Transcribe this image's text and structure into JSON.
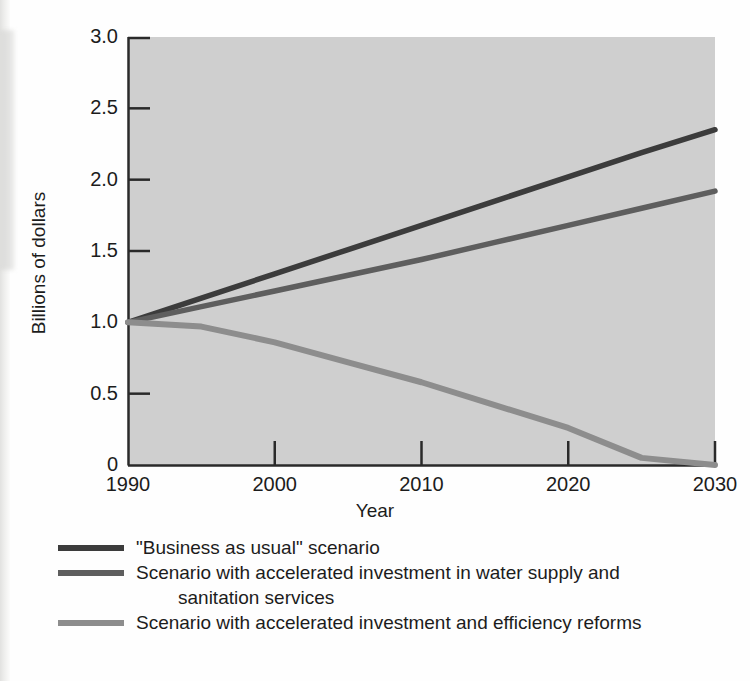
{
  "chart_data": {
    "type": "line",
    "title": "",
    "xlabel": "Year",
    "ylabel": "Billions of dollars",
    "xlim": [
      1990,
      2030
    ],
    "ylim": [
      0,
      3.0
    ],
    "grid": false,
    "legend_position": "below",
    "x_ticks": [
      "1990",
      "2000",
      "2010",
      "2020",
      "2030"
    ],
    "x_tick_values": [
      1990,
      2000,
      2010,
      2020,
      2030
    ],
    "y_ticks": [
      "0",
      "0.5",
      "1.0",
      "1.5",
      "2.0",
      "2.5",
      "3.0"
    ],
    "y_tick_values": [
      0,
      0.5,
      1.0,
      1.5,
      2.0,
      2.5,
      3.0
    ],
    "x": [
      1990,
      1995,
      2000,
      2005,
      2010,
      2015,
      2020,
      2025,
      2030
    ],
    "series": [
      {
        "name": "\"Business as usual\" scenario",
        "color": "#3c3c3c",
        "values": [
          1.0,
          1.17,
          1.34,
          1.51,
          1.68,
          1.85,
          2.02,
          2.19,
          2.35
        ]
      },
      {
        "name": "Scenario with accelerated investment in water supply and sanitation services",
        "color": "#5e5e5e",
        "values": [
          1.0,
          1.11,
          1.22,
          1.33,
          1.44,
          1.56,
          1.68,
          1.8,
          1.92
        ]
      },
      {
        "name": "Scenario with accelerated investment and efficiency reforms",
        "color": "#8d8d8d",
        "values": [
          1.0,
          0.97,
          0.86,
          0.72,
          0.58,
          0.42,
          0.26,
          0.05,
          0.0
        ]
      }
    ],
    "plot_background": "#cfcfcf"
  },
  "legend": {
    "entries": [
      {
        "label": "\"Business as usual\" scenario",
        "label_line1": "\"Business as usual\" scenario",
        "label_line2": "",
        "color": "#3c3c3c"
      },
      {
        "label": "Scenario with accelerated investment in water supply and sanitation services",
        "label_line1": "Scenario with accelerated investment in water supply and",
        "label_line2": "sanitation services",
        "color": "#5e5e5e"
      },
      {
        "label": "Scenario with accelerated investment and efficiency reforms",
        "label_line1": "Scenario with accelerated investment and efficiency reforms",
        "label_line2": "",
        "color": "#8d8d8d"
      }
    ]
  },
  "axes": {
    "y_title": "Billions of dollars",
    "x_title": "Year",
    "y_tick_labels": [
      "3.0",
      "2.5",
      "2.0",
      "1.5",
      "1.0",
      "0.5",
      "0"
    ],
    "x_tick_labels": [
      "1990",
      "2000",
      "2010",
      "2020",
      "2030"
    ]
  }
}
